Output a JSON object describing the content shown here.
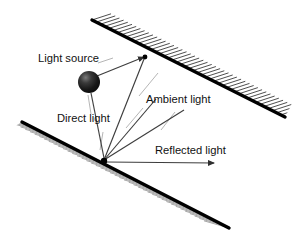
{
  "figure": {
    "background_color": "#ffffff",
    "stroke_color": "#000000",
    "hatch_color_upper": "#2b2b2b",
    "hatch_color_lower": "#8a8a8a",
    "ray_color": "#3d3d3d",
    "leader_color": "#9a9a9a",
    "text_color": "#111111"
  },
  "labels": [
    {
      "id": "light-source",
      "text": "Light source",
      "x": 38,
      "y": 62
    },
    {
      "id": "direct-light",
      "text": "Direct light",
      "x": 57,
      "y": 122
    },
    {
      "id": "ambient-light",
      "text": "Ambient light",
      "x": 146,
      "y": 103
    },
    {
      "id": "reflected-light",
      "text": "Reflected light",
      "x": 155,
      "y": 154
    }
  ],
  "surfaces": {
    "upper_wall": {
      "name": "upper-hatched-surface",
      "x1": 92,
      "y1": 20,
      "x2": 285,
      "y2": 117,
      "hatch_side": "above-right",
      "hatch_count": 46
    },
    "lower_wall": {
      "name": "lower-hatched-surface",
      "x1": 22,
      "y1": 122,
      "x2": 229,
      "y2": 228,
      "hatch_side": "below-left",
      "hatch_count": 44
    }
  },
  "light_source": {
    "name": "light-source-sphere",
    "cx": 89,
    "cy": 82,
    "r": 11,
    "fill_dark": "#1a1a1a",
    "fill_highlight": "#6e6e6e"
  },
  "surface_point": {
    "name": "surface-hit-point",
    "cx": 104,
    "cy": 161,
    "r": 3.2
  },
  "wall_point": {
    "name": "wall-hit-point",
    "cx": 145,
    "cy": 57,
    "r": 2.4
  },
  "rays": [
    {
      "id": "direct-ray-to-wall",
      "x1": 97,
      "y1": 76,
      "x2": 144,
      "y2": 57,
      "arrow": true
    },
    {
      "id": "direct-ray-to-surface",
      "x1": 91,
      "y1": 93,
      "x2": 104,
      "y2": 158,
      "arrow": false
    },
    {
      "id": "ambient-ray-1",
      "x1": 104,
      "y1": 160,
      "x2": 144,
      "y2": 59,
      "arrow": false
    },
    {
      "id": "ambient-ray-2",
      "x1": 104,
      "y1": 160,
      "x2": 156,
      "y2": 99,
      "arrow": false
    },
    {
      "id": "ambient-ray-3",
      "x1": 104,
      "y1": 160,
      "x2": 184,
      "y2": 110,
      "arrow": false
    },
    {
      "id": "reflected-ray",
      "x1": 106,
      "y1": 162,
      "x2": 214,
      "y2": 163,
      "arrow": true
    }
  ],
  "leaders": [
    {
      "id": "light-source-leader",
      "x1": 98,
      "y1": 63,
      "x2": 113,
      "y2": 58
    },
    {
      "id": "direct-light-leader",
      "x1": 91,
      "y1": 114,
      "x2": 88,
      "y2": 95
    },
    {
      "id": "direct-light-leader-2",
      "x1": 103,
      "y1": 132,
      "x2": 100,
      "y2": 150
    },
    {
      "id": "ambient-light-leader-1",
      "x1": 139,
      "y1": 96,
      "x2": 158,
      "y2": 73
    },
    {
      "id": "ambient-light-leader-2",
      "x1": 126,
      "y1": 128,
      "x2": 143,
      "y2": 108
    },
    {
      "id": "ambient-light-leader-3",
      "x1": 161,
      "y1": 130,
      "x2": 175,
      "y2": 112
    }
  ]
}
